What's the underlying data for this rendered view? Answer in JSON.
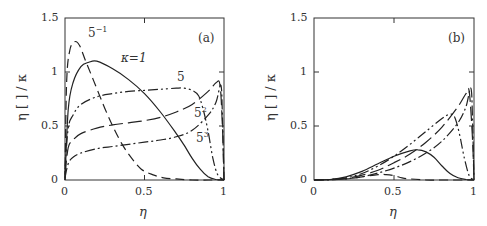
{
  "chart_data": [
    {
      "type": "line",
      "panel": "(a)",
      "xlabel": "η",
      "ylabel": "η [ ] / κ",
      "xlim": [
        0,
        1
      ],
      "ylim": [
        0,
        1.5
      ],
      "xticks": [
        "0",
        "0.5",
        "1"
      ],
      "yticks": [
        "0",
        "0.5",
        "1",
        "1.5"
      ],
      "grid": false,
      "legend": "inline curve labels",
      "series": [
        {
          "name": "κ=5^-1",
          "label": "5",
          "sup": "−1",
          "style": "dashed",
          "x": [
            0,
            0.01,
            0.03,
            0.06,
            0.09,
            0.13,
            0.18,
            0.24,
            0.3,
            0.36,
            0.42,
            0.48,
            0.55,
            0.62,
            0.7,
            0.8,
            0.9,
            1.0
          ],
          "y": [
            0,
            0.9,
            1.2,
            1.28,
            1.25,
            1.1,
            0.92,
            0.7,
            0.5,
            0.33,
            0.2,
            0.1,
            0.05,
            0.02,
            0.01,
            0.0,
            0.0,
            0.0
          ]
        },
        {
          "name": "κ=1",
          "label": "κ=1",
          "style": "solid",
          "x": [
            0,
            0.02,
            0.05,
            0.1,
            0.15,
            0.2,
            0.3,
            0.4,
            0.5,
            0.6,
            0.7,
            0.75,
            0.8,
            0.85,
            0.9,
            0.95,
            1.0
          ],
          "y": [
            0,
            0.65,
            0.9,
            1.05,
            1.09,
            1.1,
            1.03,
            0.93,
            0.8,
            0.63,
            0.43,
            0.32,
            0.2,
            0.1,
            0.03,
            0.005,
            0.0
          ]
        },
        {
          "name": "κ=5",
          "label": "5",
          "style": "dash-dot-dot",
          "x": [
            0,
            0.02,
            0.05,
            0.1,
            0.2,
            0.3,
            0.4,
            0.5,
            0.6,
            0.7,
            0.75,
            0.8,
            0.84,
            0.87,
            0.9,
            0.93,
            0.96,
            1.0
          ],
          "y": [
            0.1,
            0.48,
            0.6,
            0.7,
            0.77,
            0.8,
            0.82,
            0.83,
            0.84,
            0.85,
            0.85,
            0.83,
            0.78,
            0.65,
            0.45,
            0.2,
            0.05,
            0.0
          ]
        },
        {
          "name": "κ=5^2",
          "label": "5",
          "sup": "2",
          "style": "long-dash",
          "x": [
            0,
            0.02,
            0.05,
            0.1,
            0.2,
            0.3,
            0.4,
            0.5,
            0.6,
            0.7,
            0.8,
            0.9,
            0.95,
            0.975,
            0.99,
            1.0
          ],
          "y": [
            0.05,
            0.3,
            0.37,
            0.43,
            0.48,
            0.51,
            0.53,
            0.55,
            0.58,
            0.63,
            0.7,
            0.82,
            0.9,
            0.88,
            0.5,
            0.0
          ]
        },
        {
          "name": "κ=5^3",
          "label": "5",
          "sup": "3",
          "style": "dash-dot",
          "x": [
            0,
            0.02,
            0.05,
            0.1,
            0.2,
            0.3,
            0.4,
            0.5,
            0.6,
            0.7,
            0.8,
            0.9,
            0.95,
            0.98,
            0.99,
            1.0
          ],
          "y": [
            0.02,
            0.15,
            0.21,
            0.25,
            0.29,
            0.31,
            0.33,
            0.35,
            0.37,
            0.4,
            0.46,
            0.6,
            0.72,
            0.88,
            0.6,
            0.0
          ]
        }
      ]
    },
    {
      "type": "line",
      "panel": "(b)",
      "xlabel": "η",
      "ylabel": "η [ ] / κ",
      "xlim": [
        0,
        1
      ],
      "ylim": [
        0,
        1.5
      ],
      "xticks": [
        "0",
        "0.5",
        "1"
      ],
      "yticks": [
        "0",
        "0.5",
        "1",
        "1.5"
      ],
      "grid": false,
      "series": [
        {
          "name": "κ=5^-1",
          "style": "dashed",
          "x": [
            0,
            0.2,
            0.3,
            0.4,
            0.45,
            0.5,
            0.55,
            0.6,
            0.7,
            0.8,
            1.0
          ],
          "y": [
            0,
            0.01,
            0.03,
            0.05,
            0.05,
            0.04,
            0.02,
            0.01,
            0.0,
            0.0,
            0.0
          ]
        },
        {
          "name": "κ=1",
          "style": "solid",
          "x": [
            0,
            0.1,
            0.2,
            0.3,
            0.4,
            0.5,
            0.6,
            0.65,
            0.7,
            0.75,
            0.8,
            0.85,
            0.9,
            0.95,
            1.0
          ],
          "y": [
            0,
            0.005,
            0.03,
            0.08,
            0.15,
            0.22,
            0.27,
            0.28,
            0.26,
            0.21,
            0.13,
            0.06,
            0.02,
            0.005,
            0.0
          ]
        },
        {
          "name": "κ=5",
          "style": "dash-dot-dot",
          "x": [
            0,
            0.1,
            0.2,
            0.3,
            0.4,
            0.5,
            0.6,
            0.7,
            0.8,
            0.85,
            0.88,
            0.91,
            0.94,
            0.97,
            1.0
          ],
          "y": [
            0,
            0.005,
            0.02,
            0.06,
            0.13,
            0.22,
            0.33,
            0.45,
            0.57,
            0.61,
            0.58,
            0.42,
            0.2,
            0.04,
            0.0
          ]
        },
        {
          "name": "κ=5^2",
          "style": "long-dash",
          "x": [
            0,
            0.1,
            0.2,
            0.3,
            0.4,
            0.5,
            0.6,
            0.7,
            0.8,
            0.9,
            0.95,
            0.97,
            0.99,
            1.0
          ],
          "y": [
            0,
            0.004,
            0.015,
            0.045,
            0.09,
            0.16,
            0.24,
            0.35,
            0.49,
            0.68,
            0.8,
            0.82,
            0.4,
            0.0
          ]
        },
        {
          "name": "κ=5^3",
          "style": "dash-dot",
          "x": [
            0,
            0.1,
            0.2,
            0.3,
            0.4,
            0.5,
            0.6,
            0.7,
            0.8,
            0.9,
            0.95,
            0.98,
            0.99,
            1.0
          ],
          "y": [
            0,
            0.003,
            0.01,
            0.03,
            0.065,
            0.11,
            0.17,
            0.25,
            0.36,
            0.53,
            0.68,
            0.85,
            0.6,
            0.0
          ]
        }
      ]
    }
  ],
  "panels": {
    "a": {
      "tag": "(a)",
      "ylabel": "η [ ] / κ",
      "xlabel": "η",
      "yticks": [
        "1.5",
        "1",
        "0.5",
        "0"
      ],
      "xticks": [
        "0",
        "0.5",
        "1"
      ],
      "curve_labels": {
        "k_inv": {
          "base": "5",
          "sup": "−1"
        },
        "k1": "κ=1",
        "k5": "5",
        "k25": {
          "base": "5",
          "sup": "2"
        },
        "k125": {
          "base": "5",
          "sup": "3"
        }
      }
    },
    "b": {
      "tag": "(b)",
      "ylabel": "η [ ] / κ",
      "xlabel": "η",
      "yticks": [
        "1.5",
        "1",
        "0.5",
        "0"
      ],
      "xticks": [
        "0",
        "0.5",
        "1"
      ]
    }
  },
  "colors": {
    "line": "#222222",
    "frame": "#333333",
    "background": "#ffffff"
  }
}
